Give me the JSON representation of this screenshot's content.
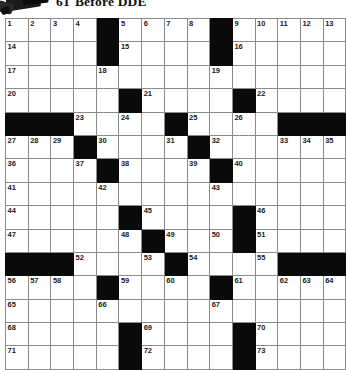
{
  "page": {
    "clue_fragment": {
      "number": "61",
      "text": "Before DDE"
    }
  },
  "puzzle": {
    "type": "crossword-grid",
    "rows": 15,
    "cols": 15,
    "colors": {
      "block": "#0a0a0a",
      "cell": "#ffffff",
      "gridline": "#8a8a8a",
      "number": "#1a1a1a"
    },
    "grid": [
      [
        {
          "n": "1"
        },
        {
          "n": "2"
        },
        {
          "n": "3"
        },
        {
          "n": "4"
        },
        {
          "b": 1
        },
        {
          "n": "5"
        },
        {
          "n": "6"
        },
        {
          "n": "7"
        },
        {
          "n": "8"
        },
        {
          "b": 1
        },
        {
          "n": "9"
        },
        {
          "n": "10"
        },
        {
          "n": "11"
        },
        {
          "n": "12"
        },
        {
          "n": "13"
        }
      ],
      [
        {
          "n": "14"
        },
        {},
        {},
        {},
        {
          "b": 1
        },
        {
          "n": "15"
        },
        {},
        {},
        {},
        {
          "b": 1
        },
        {
          "n": "16"
        },
        {},
        {},
        {},
        {}
      ],
      [
        {
          "n": "17"
        },
        {},
        {},
        {},
        {
          "n": "18"
        },
        {},
        {},
        {},
        {},
        {
          "n": "19"
        },
        {},
        {},
        {},
        {},
        {}
      ],
      [
        {
          "n": "20"
        },
        {},
        {},
        {},
        {},
        {
          "b": 1
        },
        {
          "n": "21"
        },
        {},
        {},
        {},
        {
          "b": 1
        },
        {
          "n": "22"
        },
        {},
        {},
        {}
      ],
      [
        {
          "b": 1
        },
        {
          "b": 1
        },
        {
          "b": 1
        },
        {
          "n": "23"
        },
        {},
        {
          "n": "24"
        },
        {},
        {
          "b": 1
        },
        {
          "n": "25"
        },
        {},
        {
          "n": "26"
        },
        {},
        {
          "b": 1
        },
        {
          "b": 1
        },
        {
          "b": 1
        }
      ],
      [
        {
          "n": "27"
        },
        {
          "n": "28"
        },
        {
          "n": "29"
        },
        {
          "b": 1
        },
        {
          "n": "30"
        },
        {},
        {},
        {
          "n": "31"
        },
        {
          "b": 1
        },
        {
          "n": "32"
        },
        {},
        {},
        {
          "n": "33"
        },
        {
          "n": "34"
        },
        {
          "n": "35"
        }
      ],
      [
        {
          "n": "36"
        },
        {},
        {},
        {
          "n": "37"
        },
        {
          "b": 1
        },
        {
          "n": "38"
        },
        {},
        {},
        {
          "n": "39"
        },
        {
          "b": 1
        },
        {
          "n": "40"
        },
        {},
        {},
        {},
        {}
      ],
      [
        {
          "n": "41"
        },
        {},
        {},
        {},
        {
          "n": "42"
        },
        {},
        {},
        {},
        {},
        {
          "n": "43"
        },
        {},
        {},
        {},
        {},
        {}
      ],
      [
        {
          "n": "44"
        },
        {},
        {},
        {},
        {},
        {
          "b": 1
        },
        {
          "n": "45"
        },
        {},
        {},
        {},
        {
          "b": 1
        },
        {
          "n": "46"
        },
        {},
        {},
        {}
      ],
      [
        {
          "n": "47"
        },
        {},
        {},
        {},
        {},
        {
          "n": "48"
        },
        {
          "b": 1
        },
        {
          "n": "49"
        },
        {},
        {
          "n": "50"
        },
        {
          "b": 1
        },
        {
          "n": "51"
        },
        {},
        {},
        {}
      ],
      [
        {
          "b": 1
        },
        {
          "b": 1
        },
        {
          "b": 1
        },
        {
          "n": "52"
        },
        {},
        {},
        {
          "n": "53"
        },
        {
          "b": 1
        },
        {
          "n": "54"
        },
        {},
        {},
        {
          "n": "55"
        },
        {
          "b": 1
        },
        {
          "b": 1
        },
        {
          "b": 1
        }
      ],
      [
        {
          "n": "56"
        },
        {
          "n": "57"
        },
        {
          "n": "58"
        },
        {},
        {
          "b": 1
        },
        {
          "n": "59"
        },
        {},
        {
          "n": "60"
        },
        {},
        {
          "b": 1
        },
        {
          "n": "61"
        },
        {},
        {
          "n": "62"
        },
        {
          "n": "63"
        },
        {
          "n": "64"
        }
      ],
      [
        {
          "n": "65"
        },
        {},
        {},
        {},
        {
          "n": "66"
        },
        {},
        {},
        {},
        {},
        {
          "n": "67"
        },
        {},
        {},
        {},
        {},
        {}
      ],
      [
        {
          "n": "68"
        },
        {},
        {},
        {},
        {},
        {
          "b": 1
        },
        {
          "n": "69"
        },
        {},
        {},
        {},
        {
          "b": 1
        },
        {
          "n": "70"
        },
        {},
        {},
        {}
      ],
      [
        {
          "n": "71"
        },
        {},
        {},
        {},
        {},
        {
          "b": 1
        },
        {
          "n": "72"
        },
        {},
        {},
        {},
        {
          "b": 1
        },
        {
          "n": "73"
        },
        {},
        {},
        {}
      ]
    ]
  }
}
